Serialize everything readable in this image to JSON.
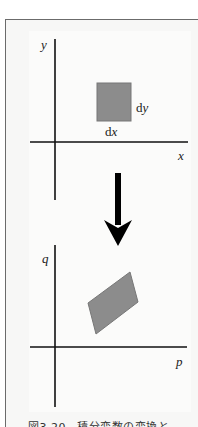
{
  "figure": {
    "top": {
      "x_axis_label": "x",
      "y_axis_label": "y",
      "width_label": "d",
      "width_var": "x",
      "height_label": "d",
      "height_var": "y"
    },
    "bottom": {
      "x_axis_label": "p",
      "y_axis_label": "q"
    },
    "caption": "図3.20　積分変数の変換と",
    "colors": {
      "shape_fill": "#8c8c8c",
      "shape_stroke": "#777777",
      "axis": "#111111",
      "arrow": "#000000"
    }
  }
}
